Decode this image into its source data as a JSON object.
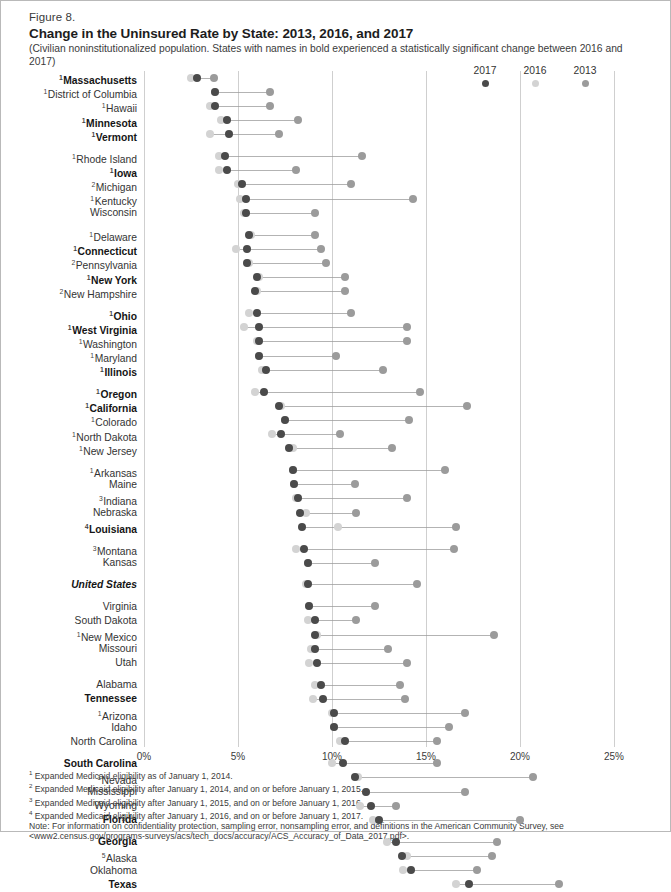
{
  "figure": {
    "number": "Figure 8.",
    "title": "Change in the Uninsured Rate by State: 2013, 2016, and 2017",
    "subtitle": "(Civilian noninstitutionalized population. States with names in bold experienced a statistically significant change between 2016 and 2017)"
  },
  "legend": {
    "items": [
      {
        "label": "2017",
        "color": "#4a4a4a"
      },
      {
        "label": "2016",
        "color": "#d3d3d3"
      },
      {
        "label": "2013",
        "color": "#9b9b9b"
      }
    ]
  },
  "footnotes": [
    {
      "marker": "1",
      "text": "Expanded Medicaid eligibility as of January 1, 2014."
    },
    {
      "marker": "2",
      "text": "Expanded Medicaid eligibility after January 1, 2014, and on or before January 1, 2015."
    },
    {
      "marker": "3",
      "text": "Expanded Medicaid eligibility after January 1, 2015, and on or before January 1, 2016."
    },
    {
      "marker": "4",
      "text": "Expanded Medicaid eligibility after January 1, 2016, and on or before January 1, 2017."
    }
  ],
  "note": "Note: For information on confidentiality protection, sampling error, nonsampling error, and definitions in the American Community Survey, see <www2.census.gov/programs-surveys/acs/tech_docs/accuracy/ACS_Accuracy_of_Data_2017.pdf>.",
  "chart_data": {
    "type": "scatter",
    "title": "Change in the Uninsured Rate by State: 2013, 2016, and 2017",
    "xlabel": "",
    "ylabel": "",
    "xlim": [
      0,
      25
    ],
    "xticks": [
      "0%",
      "5%",
      "10%",
      "15%",
      "20%",
      "25%"
    ],
    "xtick_values": [
      0,
      5,
      10,
      15,
      20,
      25
    ],
    "grid": true,
    "legend_position": "top-right",
    "series_names": [
      "2017",
      "2016",
      "2013"
    ],
    "series_colors": {
      "y2017": "#4a4a4a",
      "y2016": "#d3d3d3",
      "y2013": "#9b9b9b"
    },
    "groups": [
      {
        "rows": [
          {
            "state": "Massachusetts",
            "marker": "1",
            "bold": true,
            "y2017": 2.8,
            "y2016": 2.5,
            "y2013": 3.7
          },
          {
            "state": "District of Columbia",
            "marker": "1",
            "bold": false,
            "y2017": 3.8,
            "y2016": 3.8,
            "y2013": 6.7
          },
          {
            "state": "Hawaii",
            "marker": "1",
            "bold": false,
            "y2017": 3.8,
            "y2016": 3.5,
            "y2013": 6.7
          },
          {
            "state": "Minnesota",
            "marker": "1",
            "bold": true,
            "y2017": 4.4,
            "y2016": 4.1,
            "y2013": 8.2
          },
          {
            "state": "Vermont",
            "marker": "1",
            "bold": true,
            "y2017": 4.5,
            "y2016": 3.5,
            "y2013": 7.2
          }
        ]
      },
      {
        "rows": [
          {
            "state": "Rhode Island",
            "marker": "1",
            "bold": false,
            "y2017": 4.3,
            "y2016": 4.0,
            "y2013": 11.6
          },
          {
            "state": "Iowa",
            "marker": "1",
            "bold": true,
            "y2017": 4.4,
            "y2016": 4.0,
            "y2013": 8.1
          },
          {
            "state": "Michigan",
            "marker": "2",
            "bold": false,
            "y2017": 5.2,
            "y2016": 5.0,
            "y2013": 11.0
          },
          {
            "state": "Kentucky",
            "marker": "1",
            "bold": false,
            "y2017": 5.4,
            "y2016": 5.1,
            "y2013": 14.3
          },
          {
            "state": "Wisconsin",
            "marker": "",
            "bold": false,
            "y2017": 5.4,
            "y2016": 5.3,
            "y2013": 9.1
          }
        ]
      },
      {
        "rows": [
          {
            "state": "Delaware",
            "marker": "1",
            "bold": false,
            "y2017": 5.6,
            "y2016": 5.7,
            "y2013": 9.1
          },
          {
            "state": "Connecticut",
            "marker": "1",
            "bold": true,
            "y2017": 5.5,
            "y2016": 4.9,
            "y2013": 9.4
          },
          {
            "state": "Pennsylvania",
            "marker": "2",
            "bold": false,
            "y2017": 5.5,
            "y2016": 5.6,
            "y2013": 9.7
          },
          {
            "state": "New York",
            "marker": "1",
            "bold": true,
            "y2017": 6.0,
            "y2016": 6.1,
            "y2013": 10.7
          },
          {
            "state": "New Hampshire",
            "marker": "2",
            "bold": false,
            "y2017": 5.9,
            "y2016": 6.0,
            "y2013": 10.7
          }
        ]
      },
      {
        "rows": [
          {
            "state": "Ohio",
            "marker": "1",
            "bold": true,
            "y2017": 6.0,
            "y2016": 5.6,
            "y2013": 11.0
          },
          {
            "state": "West Virginia",
            "marker": "1",
            "bold": true,
            "y2017": 6.1,
            "y2016": 5.3,
            "y2013": 14.0
          },
          {
            "state": "Washington",
            "marker": "1",
            "bold": false,
            "y2017": 6.1,
            "y2016": 6.0,
            "y2013": 14.0
          },
          {
            "state": "Maryland",
            "marker": "1",
            "bold": false,
            "y2017": 6.1,
            "y2016": 6.1,
            "y2013": 10.2
          },
          {
            "state": "Illinois",
            "marker": "1",
            "bold": true,
            "y2017": 6.5,
            "y2016": 6.3,
            "y2013": 12.7
          }
        ]
      },
      {
        "rows": [
          {
            "state": "Oregon",
            "marker": "1",
            "bold": true,
            "y2017": 6.4,
            "y2016": 5.9,
            "y2013": 14.7
          },
          {
            "state": "California",
            "marker": "1",
            "bold": true,
            "y2017": 7.2,
            "y2016": 7.3,
            "y2013": 17.2
          },
          {
            "state": "Colorado",
            "marker": "1",
            "bold": false,
            "y2017": 7.5,
            "y2016": 7.5,
            "y2013": 14.1
          },
          {
            "state": "North Dakota",
            "marker": "1",
            "bold": false,
            "y2017": 7.3,
            "y2016": 6.8,
            "y2013": 10.4
          },
          {
            "state": "New Jersey",
            "marker": "1",
            "bold": false,
            "y2017": 7.7,
            "y2016": 7.9,
            "y2013": 13.2
          }
        ]
      },
      {
        "rows": [
          {
            "state": "Arkansas",
            "marker": "1",
            "bold": false,
            "y2017": 7.9,
            "y2016": 7.9,
            "y2013": 16.0
          },
          {
            "state": "Maine",
            "marker": "",
            "bold": false,
            "y2017": 8.0,
            "y2016": 8.0,
            "y2013": 11.2
          },
          {
            "state": "Indiana",
            "marker": "3",
            "bold": false,
            "y2017": 8.2,
            "y2016": 8.1,
            "y2013": 14.0
          },
          {
            "state": "Nebraska",
            "marker": "",
            "bold": false,
            "y2017": 8.3,
            "y2016": 8.6,
            "y2013": 11.3
          },
          {
            "state": "Louisiana",
            "marker": "4",
            "bold": true,
            "y2017": 8.4,
            "y2016": 10.3,
            "y2013": 16.6
          }
        ]
      },
      {
        "rows": [
          {
            "state": "Montana",
            "marker": "3",
            "bold": false,
            "y2017": 8.5,
            "y2016": 8.1,
            "y2013": 16.5
          },
          {
            "state": "Kansas",
            "marker": "",
            "bold": false,
            "y2017": 8.7,
            "y2016": 8.7,
            "y2013": 12.3
          }
        ]
      },
      {
        "rows": [
          {
            "state": "United States",
            "marker": "",
            "bold": false,
            "us": true,
            "y2017": 8.7,
            "y2016": 8.6,
            "y2013": 14.5
          }
        ]
      },
      {
        "rows": [
          {
            "state": "Virginia",
            "marker": "",
            "bold": false,
            "y2017": 8.8,
            "y2016": 8.8,
            "y2013": 12.3
          },
          {
            "state": "South Dakota",
            "marker": "",
            "bold": false,
            "y2017": 9.1,
            "y2016": 8.7,
            "y2013": 11.3
          },
          {
            "state": "New Mexico",
            "marker": "1",
            "bold": false,
            "y2017": 9.1,
            "y2016": 9.2,
            "y2013": 18.6
          },
          {
            "state": "Missouri",
            "marker": "",
            "bold": false,
            "y2017": 9.1,
            "y2016": 8.9,
            "y2013": 13.0
          },
          {
            "state": "Utah",
            "marker": "",
            "bold": false,
            "y2017": 9.2,
            "y2016": 8.8,
            "y2013": 14.0
          }
        ]
      },
      {
        "rows": [
          {
            "state": "Alabama",
            "marker": "",
            "bold": false,
            "y2017": 9.4,
            "y2016": 9.1,
            "y2013": 13.6
          },
          {
            "state": "Tennessee",
            "marker": "",
            "bold": true,
            "y2017": 9.5,
            "y2016": 9.0,
            "y2013": 13.9
          },
          {
            "state": "Arizona",
            "marker": "1",
            "bold": false,
            "y2017": 10.1,
            "y2016": 10.0,
            "y2013": 17.1
          },
          {
            "state": "Idaho",
            "marker": "",
            "bold": false,
            "y2017": 10.1,
            "y2016": 10.1,
            "y2013": 16.2
          },
          {
            "state": "North Carolina",
            "marker": "",
            "bold": false,
            "y2017": 10.7,
            "y2016": 10.4,
            "y2013": 15.6
          }
        ]
      },
      {
        "rows": [
          {
            "state": "South Carolina",
            "marker": "",
            "bold": true,
            "y2017": 10.6,
            "y2016": 10.0,
            "y2013": 15.6
          },
          {
            "state": "Nevada",
            "marker": "1",
            "bold": false,
            "y2017": 11.2,
            "y2016": 11.4,
            "y2013": 20.7
          },
          {
            "state": "Mississippi",
            "marker": "",
            "bold": false,
            "y2017": 11.8,
            "y2016": 11.8,
            "y2013": 17.1
          },
          {
            "state": "Wyoming",
            "marker": "",
            "bold": false,
            "y2017": 12.1,
            "y2016": 11.5,
            "y2013": 13.4
          },
          {
            "state": "Florida",
            "marker": "",
            "bold": true,
            "y2017": 12.5,
            "y2016": 12.2,
            "y2013": 20.0
          }
        ]
      },
      {
        "rows": [
          {
            "state": "Georgia",
            "marker": "",
            "bold": true,
            "y2017": 13.4,
            "y2016": 12.9,
            "y2013": 18.8
          },
          {
            "state": "Alaska",
            "marker": "5",
            "bold": false,
            "y2017": 13.7,
            "y2016": 14.0,
            "y2013": 18.5
          },
          {
            "state": "Oklahoma",
            "marker": "",
            "bold": false,
            "y2017": 14.2,
            "y2016": 13.8,
            "y2013": 17.7
          },
          {
            "state": "Texas",
            "marker": "",
            "bold": true,
            "y2017": 17.3,
            "y2016": 16.6,
            "y2013": 22.1
          }
        ]
      }
    ]
  }
}
